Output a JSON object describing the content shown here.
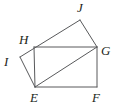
{
  "figure": {
    "width": 122,
    "height": 108,
    "background_color": "#ffffff",
    "stroke_color": "#58595b",
    "label_color": "#231f20",
    "stroke_width": 1
  },
  "points": {
    "E": {
      "name": "E",
      "x": 35,
      "y": 87
    },
    "F": {
      "name": "F",
      "x": 97,
      "y": 87
    },
    "G": {
      "name": "G",
      "x": 97,
      "y": 47
    },
    "H": {
      "name": "H",
      "x": 34,
      "y": 47
    },
    "I": {
      "name": "I",
      "x": 20,
      "y": 57
    },
    "J": {
      "name": "J",
      "x": 80,
      "y": 20
    }
  },
  "labels": [
    {
      "id": "label-J",
      "text": "J",
      "x": 77,
      "y": 1
    },
    {
      "id": "label-H",
      "text": "H",
      "x": 19,
      "y": 33
    },
    {
      "id": "label-G",
      "text": "G",
      "x": 101,
      "y": 44
    },
    {
      "id": "label-I",
      "text": "I",
      "x": 4,
      "y": 55
    },
    {
      "id": "label-E",
      "text": "E",
      "x": 30,
      "y": 91
    },
    {
      "id": "label-F",
      "text": "F",
      "x": 92,
      "y": 91
    }
  ],
  "segments": [
    {
      "id": "seg-EF",
      "from": "E",
      "to": "F",
      "label": "E to F"
    },
    {
      "id": "seg-FG",
      "from": "F",
      "to": "G",
      "label": "F to G"
    },
    {
      "id": "seg-GH",
      "from": "G",
      "to": "H",
      "label": "G to H"
    },
    {
      "id": "seg-HE",
      "from": "H",
      "to": "E",
      "label": "H to E"
    },
    {
      "id": "seg-EG",
      "from": "E",
      "to": "G",
      "label": "E to G diagonal"
    },
    {
      "id": "seg-EI",
      "from": "E",
      "to": "I",
      "label": "E to I"
    },
    {
      "id": "seg-IJ",
      "from": "I",
      "to": "J",
      "label": "I through H to J"
    },
    {
      "id": "seg-JG",
      "from": "J",
      "to": "G",
      "label": "J to G"
    }
  ]
}
